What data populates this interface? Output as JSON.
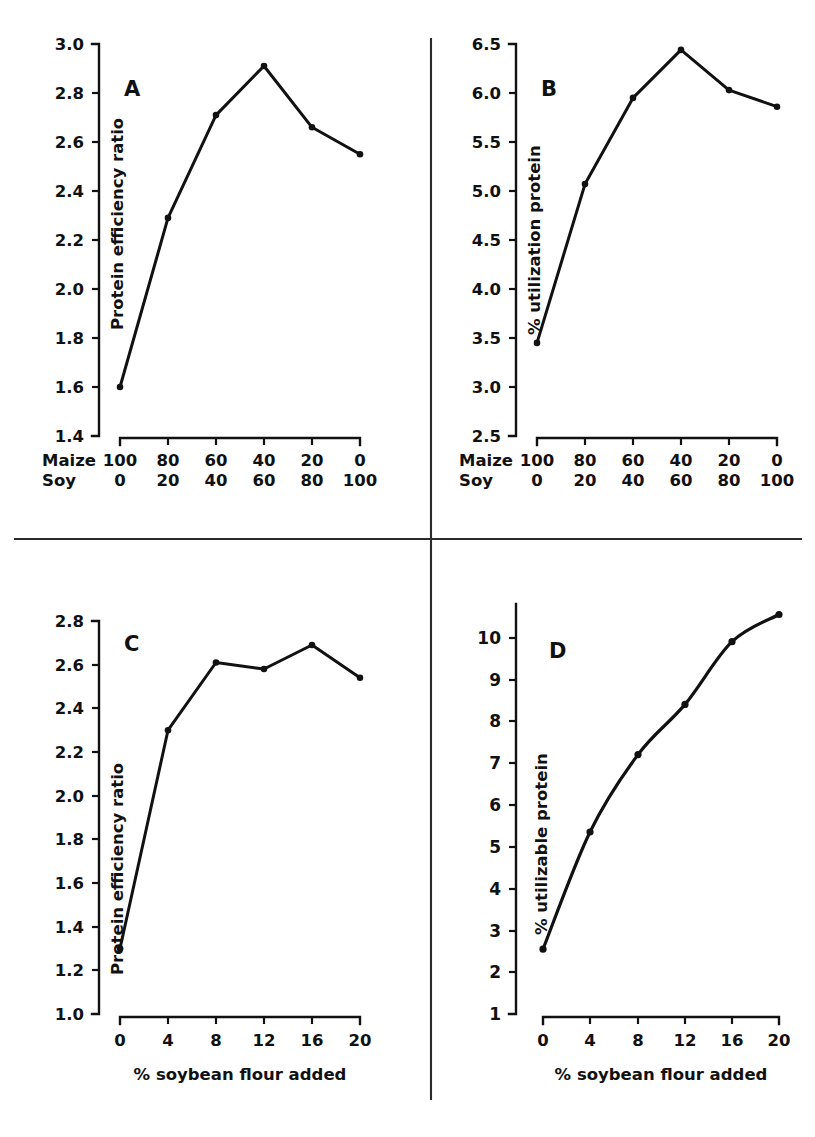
{
  "figure": {
    "background_color": "#ffffff",
    "ink_color": "#111111",
    "panel_count": 4
  },
  "panels": [
    {
      "letter": "A",
      "ylabel": "Protein efficiency ratio",
      "y_ticks": [
        "3.0",
        "2.8",
        "2.6",
        "2.4",
        "2.2",
        "2.0",
        "1.8",
        "1.6",
        "1.4"
      ],
      "x_rows": [
        {
          "name": "Maize",
          "values": [
            "100",
            "80",
            "60",
            "40",
            "20",
            "0"
          ]
        },
        {
          "name": "Soy",
          "values": [
            "0",
            "20",
            "40",
            "60",
            "80",
            "100"
          ]
        }
      ]
    },
    {
      "letter": "B",
      "ylabel": "% utilization protein",
      "y_ticks": [
        "6.5",
        "6.0",
        "5.5",
        "5.0",
        "4.5",
        "4.0",
        "3.5",
        "3.0",
        "2.5"
      ],
      "x_rows": [
        {
          "name": "Maize",
          "values": [
            "100",
            "80",
            "60",
            "40",
            "20",
            "0"
          ]
        },
        {
          "name": "Soy",
          "values": [
            "0",
            "20",
            "40",
            "60",
            "80",
            "100"
          ]
        }
      ]
    },
    {
      "letter": "C",
      "ylabel": "Protein efficiency ratio",
      "xlabel": "% soybean flour added",
      "y_ticks": [
        "2.8",
        "2.6",
        "2.4",
        "2.2",
        "2.0",
        "1.8",
        "1.6",
        "1.4",
        "1.2",
        "1.0"
      ],
      "x_ticks": [
        "0",
        "4",
        "8",
        "12",
        "16",
        "20"
      ]
    },
    {
      "letter": "D",
      "ylabel": "% utilizable protein",
      "xlabel": "% soybean flour added",
      "y_ticks": [
        "10",
        "9",
        "8",
        "7",
        "6",
        "5",
        "4",
        "3",
        "2",
        "1"
      ],
      "x_ticks": [
        "0",
        "4",
        "8",
        "12",
        "16",
        "20"
      ]
    }
  ],
  "chart_data": [
    {
      "type": "line",
      "panel": "A",
      "title": "A",
      "xlabel": "",
      "ylabel": "Protein efficiency ratio",
      "categories": [
        "100/0",
        "80/20",
        "60/40",
        "40/60",
        "20/80",
        "0/100"
      ],
      "x": [
        0,
        1,
        2,
        3,
        4,
        5
      ],
      "values": [
        1.6,
        2.29,
        2.71,
        2.91,
        2.66,
        2.55
      ],
      "ylim": [
        1.4,
        3.0
      ],
      "ytick_step": 0.2,
      "grid": false,
      "legend": "none",
      "markers": true,
      "x_axis_rows": {
        "Maize": [
          100,
          80,
          60,
          40,
          20,
          0
        ],
        "Soy": [
          0,
          20,
          40,
          60,
          80,
          100
        ]
      }
    },
    {
      "type": "line",
      "panel": "B",
      "title": "B",
      "xlabel": "",
      "ylabel": "% utilization protein",
      "categories": [
        "100/0",
        "80/20",
        "60/40",
        "40/60",
        "20/80",
        "0/100"
      ],
      "x": [
        0,
        1,
        2,
        3,
        4,
        5
      ],
      "values": [
        3.45,
        5.07,
        5.95,
        6.44,
        6.03,
        5.86
      ],
      "ylim": [
        2.5,
        6.5
      ],
      "ytick_step": 0.5,
      "grid": false,
      "legend": "none",
      "markers": true,
      "x_axis_rows": {
        "Maize": [
          100,
          80,
          60,
          40,
          20,
          0
        ],
        "Soy": [
          0,
          20,
          40,
          60,
          80,
          100
        ]
      }
    },
    {
      "type": "line",
      "panel": "C",
      "title": "C",
      "xlabel": "% soybean flour added",
      "ylabel": "Protein efficiency ratio",
      "x": [
        0,
        4,
        8,
        12,
        16,
        20
      ],
      "values": [
        1.3,
        2.3,
        2.61,
        2.58,
        2.69,
        2.54
      ],
      "xlim": [
        0,
        20
      ],
      "ylim": [
        1.0,
        2.8
      ],
      "ytick_step": 0.2,
      "xtick_step": 4,
      "grid": false,
      "legend": "none",
      "markers": true
    },
    {
      "type": "scatter",
      "panel": "D",
      "title": "D",
      "xlabel": "% soybean flour added",
      "ylabel": "% utilizable protein",
      "x": [
        0,
        4,
        8,
        12,
        16,
        20
      ],
      "values": [
        2.55,
        5.35,
        7.2,
        8.4,
        9.9,
        10.55
      ],
      "fitted_curve": true,
      "fitted_curve_note": "smooth concave fit through points; the 12% point lies slightly below the fitted curve",
      "xlim": [
        0,
        20
      ],
      "ylim": [
        1,
        10.8
      ],
      "ytick_step": 1,
      "xtick_step": 4,
      "grid": false,
      "legend": "none",
      "markers": true
    }
  ]
}
